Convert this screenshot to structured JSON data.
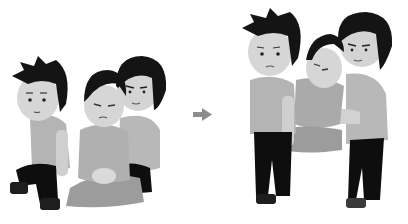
{
  "illustration": {
    "description": "Two-step rescue carry: two helpers lift a seated injured person by forming a seat with their arms",
    "panels": [
      {
        "id": "before",
        "label": "Helpers kneeling beside seated injured person"
      },
      {
        "id": "after",
        "label": "Helpers standing, carrying injured person between them"
      }
    ],
    "arrow": "right-arrow",
    "colors": {
      "background": "#ffffff",
      "hair": "#141414",
      "skin": "#d8d8d8",
      "shirt": "#b4b4b4",
      "shirt_dark": "#a0a0a0",
      "pants": "#0e0e0e",
      "shoes": "#2a2a2a",
      "victim_pants": "#9a9a9a",
      "arrow": "#8c8c8c"
    }
  }
}
